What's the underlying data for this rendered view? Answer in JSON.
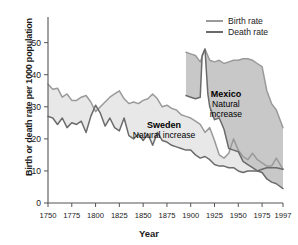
{
  "chart_data": {
    "type": "area",
    "title": "",
    "xlabel": "Year",
    "ylabel": "Birth or death rate per 1000 population",
    "xlim": [
      1750,
      1997
    ],
    "ylim": [
      0,
      58
    ],
    "yticks": [
      0,
      10,
      20,
      30,
      40,
      50
    ],
    "xticks": [
      1750,
      1775,
      1800,
      1825,
      1850,
      1875,
      1900,
      1925,
      1950,
      1975,
      1997
    ],
    "grid": false,
    "legend_position": "top-right",
    "legend": [
      {
        "label": "Birth rate",
        "color": "#9a9a9a"
      },
      {
        "label": "Death rate",
        "color": "#6b6b6b"
      }
    ],
    "annotations": [
      {
        "id": "sweden",
        "lines": [
          "Sweden",
          "Natural increase"
        ],
        "bold_first": true,
        "x": 1872,
        "y": 23.5
      },
      {
        "id": "mexico",
        "lines": [
          "Mexico",
          "Natural",
          "increase"
        ],
        "bold_first": true,
        "x": 1937,
        "y": 33.0
      }
    ],
    "fills": [
      {
        "id": "sweden-natural-increase",
        "color": "#e8e8e8",
        "between": [
          "sweden_birth",
          "sweden_death"
        ]
      },
      {
        "id": "mexico-natural-increase",
        "color": "#c8c8c8",
        "between": [
          "mexico_birth",
          "mexico_death"
        ]
      }
    ],
    "series": [
      {
        "name": "sweden_birth",
        "country": "Sweden",
        "measure": "Birth rate",
        "color": "#9a9a9a",
        "x": [
          1750,
          1755,
          1760,
          1765,
          1770,
          1775,
          1780,
          1785,
          1790,
          1795,
          1800,
          1805,
          1810,
          1815,
          1820,
          1825,
          1830,
          1835,
          1840,
          1845,
          1850,
          1855,
          1860,
          1865,
          1870,
          1875,
          1880,
          1885,
          1890,
          1895,
          1900,
          1905,
          1910,
          1915,
          1920,
          1925,
          1930,
          1935,
          1940,
          1945,
          1950,
          1955,
          1960,
          1965,
          1970,
          1975,
          1980,
          1985,
          1990,
          1997
        ],
        "values": [
          37.0,
          35.5,
          35.8,
          33.0,
          34.0,
          32.0,
          32.0,
          33.0,
          33.5,
          31.5,
          28.5,
          30.0,
          31.5,
          33.0,
          34.0,
          35.0,
          32.5,
          31.0,
          31.5,
          31.0,
          32.0,
          32.5,
          34.0,
          32.5,
          30.0,
          30.5,
          29.5,
          29.0,
          27.5,
          27.0,
          26.5,
          25.5,
          24.5,
          22.0,
          23.5,
          19.5,
          15.0,
          14.0,
          15.5,
          20.0,
          16.5,
          14.5,
          13.5,
          15.5,
          13.5,
          12.5,
          11.5,
          11.5,
          14.0,
          10.5
        ]
      },
      {
        "name": "sweden_death",
        "country": "Sweden",
        "measure": "Death rate",
        "color": "#6b6b6b",
        "x": [
          1750,
          1755,
          1760,
          1765,
          1770,
          1775,
          1780,
          1785,
          1790,
          1795,
          1800,
          1805,
          1810,
          1815,
          1820,
          1825,
          1830,
          1835,
          1840,
          1845,
          1850,
          1855,
          1860,
          1865,
          1870,
          1875,
          1880,
          1885,
          1890,
          1895,
          1900,
          1905,
          1910,
          1915,
          1920,
          1925,
          1930,
          1935,
          1940,
          1945,
          1950,
          1955,
          1960,
          1965,
          1970,
          1975,
          1980,
          1985,
          1990,
          1997
        ],
        "values": [
          27.0,
          26.5,
          24.5,
          26.5,
          23.5,
          25.0,
          24.5,
          25.5,
          22.0,
          27.0,
          30.5,
          28.0,
          24.0,
          26.5,
          23.5,
          22.5,
          26.5,
          21.0,
          20.0,
          21.5,
          19.5,
          21.5,
          18.0,
          22.0,
          19.5,
          19.0,
          18.0,
          17.5,
          17.0,
          16.5,
          16.5,
          15.0,
          14.0,
          14.5,
          13.5,
          12.0,
          11.5,
          11.5,
          11.0,
          11.0,
          10.0,
          9.5,
          10.0,
          10.0,
          10.0,
          10.5,
          11.0,
          11.0,
          11.0,
          10.5
        ]
      },
      {
        "name": "mexico_birth",
        "country": "Mexico",
        "measure": "Birth rate",
        "color": "#9a9a9a",
        "x": [
          1895,
          1900,
          1905,
          1910,
          1915,
          1920,
          1925,
          1930,
          1935,
          1940,
          1945,
          1950,
          1955,
          1960,
          1965,
          1970,
          1975,
          1980,
          1985,
          1990,
          1997
        ],
        "values": [
          47.0,
          46.5,
          46.0,
          44.0,
          48.0,
          44.5,
          44.0,
          44.5,
          43.5,
          44.0,
          44.5,
          44.5,
          45.0,
          45.0,
          44.5,
          43.5,
          42.5,
          35.0,
          31.0,
          29.0,
          23.5
        ]
      },
      {
        "name": "mexico_death",
        "country": "Mexico",
        "measure": "Death rate",
        "color": "#6b6b6b",
        "x": [
          1895,
          1900,
          1905,
          1910,
          1912,
          1915,
          1918,
          1920,
          1925,
          1930,
          1935,
          1940,
          1945,
          1950,
          1955,
          1960,
          1965,
          1970,
          1975,
          1980,
          1985,
          1990,
          1997
        ],
        "values": [
          33.5,
          33.0,
          32.5,
          33.0,
          46.0,
          48.0,
          34.0,
          30.0,
          26.0,
          26.5,
          23.0,
          17.0,
          16.5,
          16.0,
          13.0,
          12.0,
          11.0,
          10.0,
          9.5,
          7.5,
          6.5,
          6.0,
          4.5
        ]
      }
    ]
  }
}
